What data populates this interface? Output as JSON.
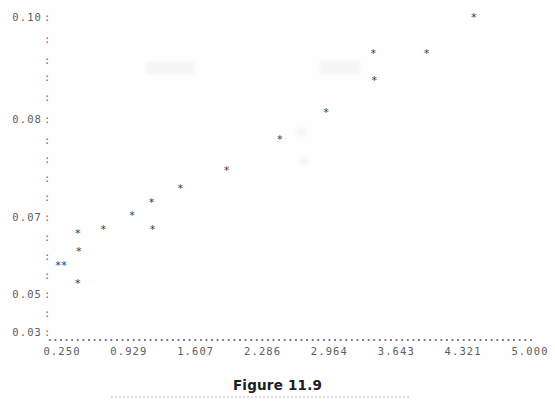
{
  "caption": "Figure 11.9",
  "chart_data": {
    "type": "scatter",
    "title": "Figure 11.9",
    "xlabel": "",
    "ylabel": "",
    "marker": "*",
    "marker_color": "#3c3c3c",
    "grid": false,
    "legend": null,
    "xlim": [
      0.25,
      5.0
    ],
    "ylim": [
      0.03,
      0.1
    ],
    "xticks": [
      0.25,
      0.929,
      1.607,
      2.286,
      2.964,
      3.643,
      4.321,
      5.0
    ],
    "xtick_labels": [
      "0.250",
      "0.929",
      "1.607",
      "2.286",
      "2.964",
      "3.643",
      "4.321",
      "5.000"
    ],
    "yticks": [
      0.1,
      0.08,
      0.07,
      0.05,
      0.03
    ],
    "ytick_labels": [
      "0.10",
      "0.08",
      "0.07",
      "0.05",
      "0.03"
    ],
    "ytick_label_suffix": ":",
    "y_minor_tick_marks": ":",
    "points": [
      {
        "x": 0.21,
        "y": 0.045
      },
      {
        "x": 0.27,
        "y": 0.045
      },
      {
        "x": 0.41,
        "y": 0.052
      },
      {
        "x": 0.42,
        "y": 0.048
      },
      {
        "x": 0.41,
        "y": 0.041
      },
      {
        "x": 0.67,
        "y": 0.053
      },
      {
        "x": 0.96,
        "y": 0.056
      },
      {
        "x": 1.16,
        "y": 0.059
      },
      {
        "x": 1.17,
        "y": 0.053
      },
      {
        "x": 1.45,
        "y": 0.062
      },
      {
        "x": 1.92,
        "y": 0.066
      },
      {
        "x": 2.46,
        "y": 0.073
      },
      {
        "x": 2.93,
        "y": 0.079
      },
      {
        "x": 3.41,
        "y": 0.092
      },
      {
        "x": 3.42,
        "y": 0.086
      },
      {
        "x": 3.95,
        "y": 0.092
      },
      {
        "x": 4.43,
        "y": 0.1
      },
      {
        "x": 4.84,
        "y": 0.107
      }
    ]
  },
  "axis_geometry": {
    "x_pixel_at_min": 62,
    "x_pixel_at_max": 530,
    "y_pixel_at_0p10": 17,
    "y_pixel_at_0p03": 332,
    "y_tick_pixels": [
      17,
      39,
      60,
      77,
      97,
      119,
      140,
      159,
      178,
      197,
      217,
      237,
      256,
      275,
      294,
      313,
      332
    ],
    "y_labeled_indices": [
      0,
      5,
      10,
      14,
      16
    ]
  },
  "colors": {
    "background": "#fefefe",
    "axis_text": "#5d5d5d",
    "marker": "#3c3c3c",
    "caption_text": "#202020",
    "axis_dots": "#7a7a7a"
  }
}
